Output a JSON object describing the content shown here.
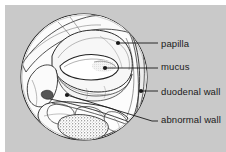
{
  "figure": {
    "kind": "medical-illustration",
    "view": "endoscopic-circular-view",
    "background_color": "#c9c9c9",
    "page_color": "#ffffff",
    "ink_color": "#1a1a1a"
  },
  "labels": [
    {
      "id": "papilla",
      "text": "papilla",
      "marker_x": 118,
      "marker_y": 43,
      "text_x": 161,
      "text_y": 39
    },
    {
      "id": "mucus",
      "text": "mucus",
      "marker_x": 105,
      "marker_y": 68,
      "text_x": 161,
      "text_y": 62
    },
    {
      "id": "duodenal-wall",
      "text": "duodenal wall",
      "marker_x": 141,
      "marker_y": 91,
      "text_x": 161,
      "text_y": 87
    },
    {
      "id": "abnormal-wall",
      "text": "abnormal wall",
      "marker_x": 67,
      "marker_y": 95,
      "text_x": 161,
      "text_y": 115
    }
  ]
}
